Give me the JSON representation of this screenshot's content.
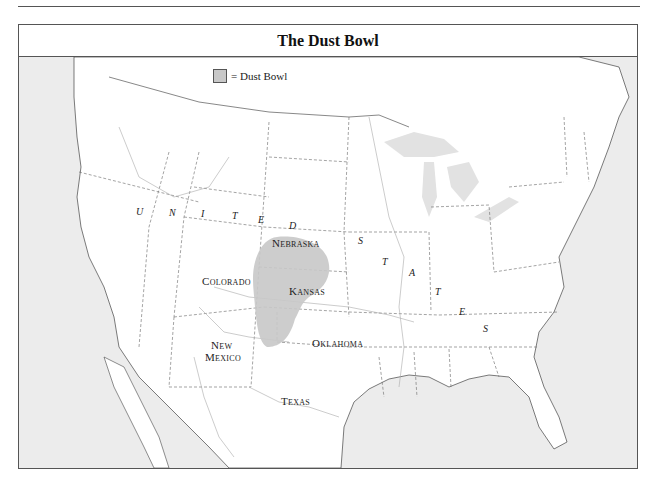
{
  "title": "The Dust Bowl",
  "legend": {
    "swatch_color": "#c8c8c8",
    "label": "= Dust Bowl"
  },
  "colors": {
    "land": "#ffffff",
    "water": "#ececec",
    "dust_bowl": "#c8c8c8",
    "border": "#555555"
  },
  "state_labels": {
    "nebraska": "Nebraska",
    "colorado": "Colorado",
    "kansas": "Kansas",
    "new_mexico_line1": "New",
    "new_mexico_line2": "Mexico",
    "oklahoma": "Oklahoma",
    "texas": "Texas"
  },
  "country_label": {
    "letters": [
      "U",
      "N",
      "I",
      "T",
      "E",
      "D",
      "S",
      "T",
      "A",
      "T",
      "E",
      "S"
    ]
  }
}
